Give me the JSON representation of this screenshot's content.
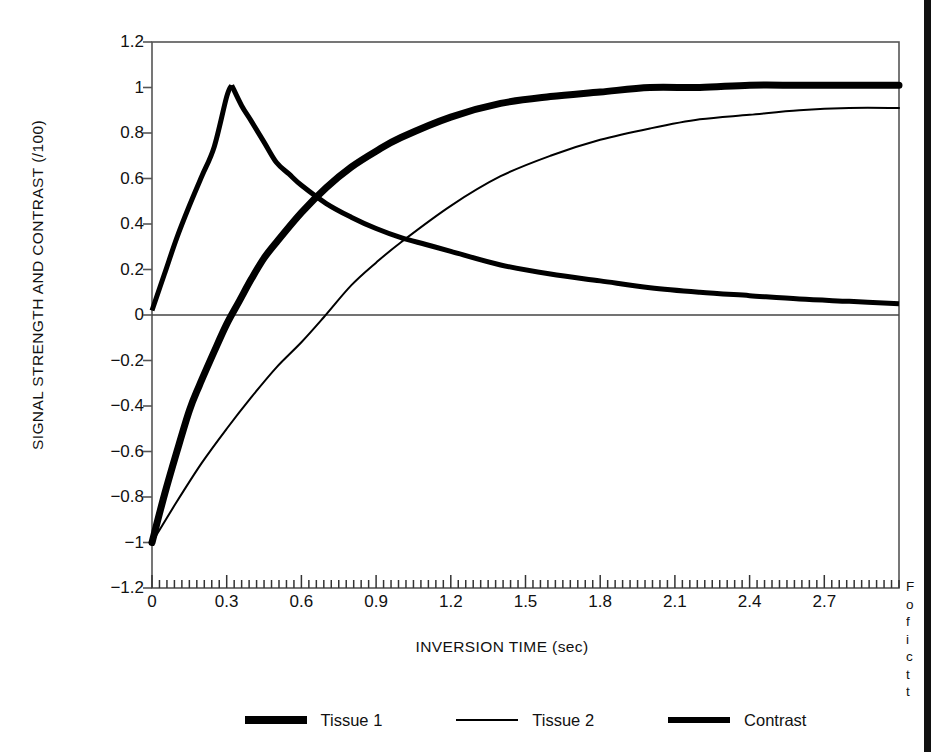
{
  "chart_data": {
    "type": "line",
    "title": "",
    "xlabel": "INVERSION TIME (sec)",
    "ylabel": "SIGNAL STRENGTH AND CONTRAST (/100)",
    "xlim": [
      0,
      3.0
    ],
    "ylim": [
      -1.2,
      1.2
    ],
    "grid": false,
    "legend_position": "bottom",
    "x_tick_labels": [
      "0",
      "0.3",
      "0.6",
      "0.9",
      "1.2",
      "1.5",
      "1.8",
      "2.1",
      "2.4",
      "2.7"
    ],
    "x_tick_values": [
      0,
      0.3,
      0.6,
      0.9,
      1.2,
      1.5,
      1.8,
      2.1,
      2.4,
      2.7
    ],
    "x_minor_tick_step": 0.03,
    "y_tick_labels": [
      "1.2",
      "1",
      "0.8",
      "0.6",
      "0.4",
      "0.2",
      "0",
      "-0.2",
      "-0.4",
      "-0.6",
      "-0.8",
      "-1",
      "-1.2"
    ],
    "y_tick_values": [
      1.2,
      1,
      0.8,
      0.6,
      0.4,
      0.2,
      0,
      -0.2,
      -0.4,
      -0.6,
      -0.8,
      -1,
      -1.2
    ],
    "zero_line": true,
    "annotations": [],
    "series": [
      {
        "name": "Tissue 1",
        "style": "very-thick",
        "color": "#000000",
        "line_width": 7,
        "model": "inversion-recovery",
        "t1": 0.45,
        "asymptote": 1.01,
        "start_value": -1.0,
        "zero_crossing": 0.19,
        "end_value": 1.01,
        "x": [
          0,
          0.05,
          0.1,
          0.15,
          0.19,
          0.25,
          0.3,
          0.35,
          0.4,
          0.45,
          0.5,
          0.6,
          0.7,
          0.8,
          0.9,
          1.0,
          1.2,
          1.4,
          1.6,
          1.8,
          2.0,
          2.2,
          2.4,
          2.6,
          2.8,
          3.0
        ],
        "y": [
          -1.0,
          -0.79,
          -0.6,
          -0.42,
          -0.31,
          -0.16,
          -0.04,
          0.06,
          0.16,
          0.25,
          0.32,
          0.45,
          0.56,
          0.65,
          0.72,
          0.78,
          0.87,
          0.93,
          0.96,
          0.98,
          1.0,
          1.0,
          1.01,
          1.01,
          1.01,
          1.01
        ]
      },
      {
        "name": "Tissue 2",
        "style": "thin",
        "color": "#000000",
        "line_width": 2,
        "model": "inversion-recovery",
        "t1": 1.0,
        "asymptote": 0.91,
        "start_value": -1.0,
        "zero_crossing": 0.69,
        "end_value": 0.91,
        "x": [
          0,
          0.1,
          0.2,
          0.3,
          0.4,
          0.5,
          0.6,
          0.69,
          0.8,
          0.9,
          1.0,
          1.2,
          1.4,
          1.6,
          1.8,
          2.0,
          2.2,
          2.4,
          2.6,
          2.8,
          3.0
        ],
        "y": [
          -1.0,
          -0.82,
          -0.65,
          -0.5,
          -0.36,
          -0.23,
          -0.12,
          -0.01,
          0.13,
          0.23,
          0.32,
          0.48,
          0.61,
          0.7,
          0.77,
          0.82,
          0.86,
          0.88,
          0.9,
          0.91,
          0.91
        ]
      },
      {
        "name": "Contrast",
        "style": "thick",
        "color": "#000000",
        "line_width": 5,
        "model": "difference",
        "start_value": 0.02,
        "peak_x": 0.32,
        "peak_y": 1.01,
        "end_value": 0.05,
        "x": [
          0,
          0.05,
          0.1,
          0.15,
          0.2,
          0.25,
          0.3,
          0.32,
          0.36,
          0.4,
          0.45,
          0.5,
          0.55,
          0.6,
          0.7,
          0.8,
          0.9,
          1.0,
          1.1,
          1.2,
          1.4,
          1.6,
          1.8,
          2.0,
          2.2,
          2.4,
          2.6,
          2.8,
          3.0
        ],
        "y": [
          0.02,
          0.18,
          0.34,
          0.48,
          0.61,
          0.74,
          0.96,
          1.01,
          0.92,
          0.85,
          0.76,
          0.67,
          0.62,
          0.57,
          0.49,
          0.43,
          0.38,
          0.34,
          0.31,
          0.28,
          0.22,
          0.18,
          0.15,
          0.12,
          0.1,
          0.085,
          0.07,
          0.06,
          0.05
        ]
      }
    ]
  },
  "legend": {
    "items": [
      {
        "label": "Tissue 1"
      },
      {
        "label": "Tissue 2"
      },
      {
        "label": "Contrast"
      }
    ]
  },
  "caption": {
    "lines": [
      "F",
      "o",
      "f",
      "i",
      "c",
      "t",
      "t"
    ]
  }
}
